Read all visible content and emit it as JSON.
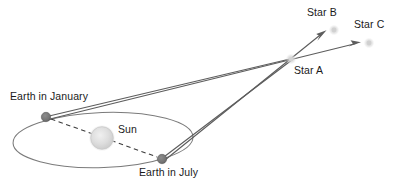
{
  "diagram": {
    "colors": {
      "background": "#ffffff",
      "orbit_line": "#7b7b7b",
      "sight_line": "#5d5d5d",
      "dashed_line": "#3a3a3a",
      "earth_body": "#767676",
      "earth_body_edge": "#5e5e5e",
      "sun_body": "#d9d9d9",
      "sun_body_edge": "#c4c4c4",
      "star_body": "#d2d2d2",
      "label_text": "#1a1a1a"
    },
    "labels": {
      "earth_january": "Earth in January",
      "earth_july": "Earth in July",
      "sun": "Sun",
      "star_a": "Star A",
      "star_b": "Star B",
      "star_c": "Star C"
    },
    "bodies": [
      {
        "id": "earth-january",
        "label": "Earth in January",
        "x": 46,
        "y": 117,
        "r": 4.6,
        "kind": "planet"
      },
      {
        "id": "earth-july",
        "label": "Earth in July",
        "x": 162,
        "y": 159,
        "r": 4.6,
        "kind": "planet"
      },
      {
        "id": "sun",
        "label": "Sun",
        "x": 102,
        "y": 138,
        "r": 11.5,
        "kind": "star-near"
      },
      {
        "id": "star-a",
        "label": "Star A",
        "x": 291,
        "y": 59,
        "r": 4.0,
        "kind": "star-far"
      },
      {
        "id": "star-b",
        "label": "Star B",
        "x": 334,
        "y": 30,
        "r": 4.0,
        "kind": "star-far"
      },
      {
        "id": "star-c",
        "label": "Star C",
        "x": 369,
        "y": 43,
        "r": 4.0,
        "kind": "star-far"
      }
    ],
    "orbit": {
      "cx": 103,
      "cy": 140,
      "rx": 90,
      "ry": 27.5,
      "rotation": -2
    },
    "dashed_segments": [
      {
        "id": "january-to-sun",
        "x1": 51,
        "y1": 119,
        "x2": 157,
        "y2": 157
      }
    ],
    "sight_lines": [
      {
        "id": "january-to-star-a",
        "x1": 46,
        "y1": 117,
        "x2": 291,
        "y2": 59,
        "arrow": false
      },
      {
        "id": "january-through-star-a-to-star-c",
        "x1": 47,
        "y1": 119,
        "x2": 359,
        "y2": 42,
        "arrow": true
      },
      {
        "id": "july-to-star-a",
        "x1": 162,
        "y1": 159,
        "x2": 291,
        "y2": 59,
        "arrow": false
      },
      {
        "id": "july-through-star-a-to-star-b",
        "x1": 164,
        "y1": 160,
        "x2": 325,
        "y2": 31,
        "arrow": true
      }
    ],
    "label_positions": [
      {
        "id": "label-earth-january",
        "text": "Earth in January",
        "left": 10,
        "top": 91,
        "anchor": "left"
      },
      {
        "id": "label-sun",
        "text": "Sun",
        "left": 118,
        "top": 124,
        "anchor": "left"
      },
      {
        "id": "label-earth-july",
        "text": "Earth in July",
        "left": 139,
        "top": 167,
        "anchor": "left"
      },
      {
        "id": "label-star-a",
        "text": "Star A",
        "left": 294,
        "top": 65,
        "anchor": "left"
      },
      {
        "id": "label-star-b",
        "text": "Star B",
        "left": 307,
        "top": 7,
        "anchor": "left"
      },
      {
        "id": "label-star-c",
        "text": "Star C",
        "left": 354,
        "top": 19,
        "anchor": "left"
      }
    ]
  }
}
